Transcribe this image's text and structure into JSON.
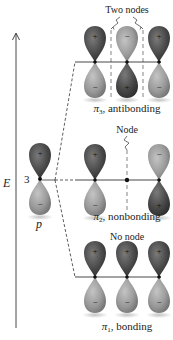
{
  "axis": {
    "label": "E",
    "arrow": "up"
  },
  "atomic_orbital": {
    "label": "p",
    "count_label": "3",
    "top_sign": "+",
    "bottom_sign": "−"
  },
  "levels": [
    {
      "id": "pi3",
      "symbol": "π",
      "subscript": "3",
      "name": ", antibonding",
      "node_label": "Two nodes",
      "orbitals": [
        {
          "top": "+",
          "bottom": "−"
        },
        {
          "top": "−",
          "bottom": "+"
        },
        {
          "top": "+",
          "bottom": "−"
        }
      ]
    },
    {
      "id": "pi2",
      "symbol": "π",
      "subscript": "2",
      "name": ", nonbonding",
      "node_label": "Node",
      "orbitals": [
        {
          "top": "+",
          "bottom": "−"
        },
        {
          "top": "",
          "bottom": ""
        },
        {
          "top": "−",
          "bottom": "+"
        }
      ]
    },
    {
      "id": "pi1",
      "symbol": "π",
      "subscript": "1",
      "name": ", bonding",
      "node_label": "No node",
      "orbitals": [
        {
          "top": "+",
          "bottom": "−"
        },
        {
          "top": "+",
          "bottom": "−"
        },
        {
          "top": "+",
          "bottom": "−"
        }
      ]
    }
  ],
  "colors": {
    "dark_lobe": "#4a4a4a",
    "light_lobe": "#9a9a9a",
    "line": "#333333"
  }
}
